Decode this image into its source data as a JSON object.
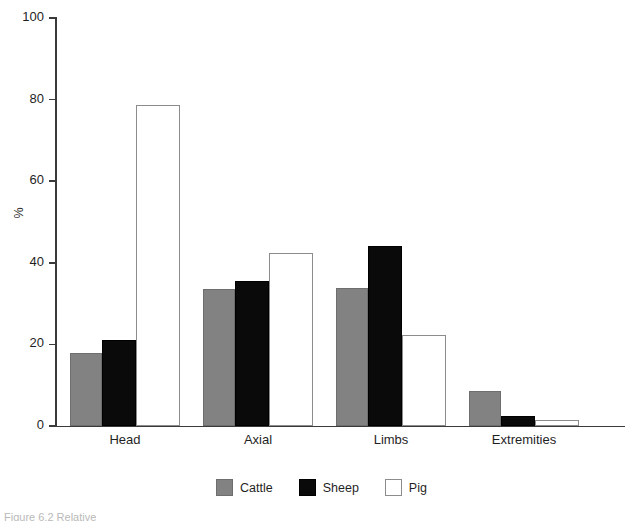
{
  "chart_data": {
    "type": "bar",
    "title": "",
    "subtitle": "",
    "xlabel": "",
    "ylabel": "%",
    "ylim": [
      0,
      100
    ],
    "yticks": [
      0,
      20,
      40,
      60,
      80,
      100
    ],
    "ytick_labels": [
      "0",
      "20",
      "40",
      "60",
      "80",
      "100"
    ],
    "grid": false,
    "legend_position": "bottom-center",
    "categories": [
      "Head",
      "Axial",
      "Limbs",
      "Extremities"
    ],
    "series": [
      {
        "name": "Cattle",
        "color": "#828282",
        "values": [
          18.0,
          33.7,
          33.8,
          8.7
        ]
      },
      {
        "name": "Sheep",
        "color": "#0a0a0a",
        "values": [
          21.2,
          35.5,
          44.0,
          2.4
        ]
      },
      {
        "name": "Pig",
        "color": "#ffffff",
        "values": [
          78.7,
          42.5,
          22.4,
          1.5
        ]
      }
    ]
  },
  "axis": {
    "y_title": "%"
  },
  "legend": {
    "items": [
      {
        "label": "Cattle",
        "swatch": "cattle"
      },
      {
        "label": "Sheep",
        "swatch": "sheep"
      },
      {
        "label": "Pig",
        "swatch": "pig"
      }
    ]
  },
  "caption": {
    "text": "Figure 6.2 Relative"
  }
}
